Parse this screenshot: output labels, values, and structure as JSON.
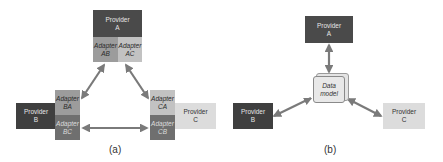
{
  "panel_a": {
    "caption": "(a)",
    "provider_a": {
      "line1": "Provider",
      "line2": "A"
    },
    "adapter_ab": {
      "line1": "Adapter",
      "line2": "AB"
    },
    "adapter_ac": {
      "line1": "Adapter",
      "line2": "AC"
    },
    "provider_b": {
      "line1": "Provider",
      "line2": "B"
    },
    "adapter_ba": {
      "line1": "Adapter",
      "line2": "BA"
    },
    "adapter_bc": {
      "line1": "Adapter",
      "line2": "BC"
    },
    "provider_c": {
      "line1": "Provider",
      "line2": "C"
    },
    "adapter_ca": {
      "line1": "Adapter",
      "line2": "CA"
    },
    "adapter_cb": {
      "line1": "Adapter",
      "line2": "CB"
    }
  },
  "panel_b": {
    "caption": "(b)",
    "provider_a": {
      "line1": "Provider",
      "line2": "A"
    },
    "data_model": {
      "line1": "Data",
      "line2": "model"
    },
    "provider_b": {
      "line1": "Provider",
      "line2": "B"
    },
    "provider_c": {
      "line1": "Provider",
      "line2": "C"
    }
  },
  "colors": {
    "provider_dark": "#4a4a4a",
    "provider_light": "#dcdcdc",
    "adapter_mid": "#9c9c9c",
    "adapter_light": "#c2c2c2",
    "adapter_dark": "#6f6f6f",
    "arrow": "#7a7a7a"
  }
}
